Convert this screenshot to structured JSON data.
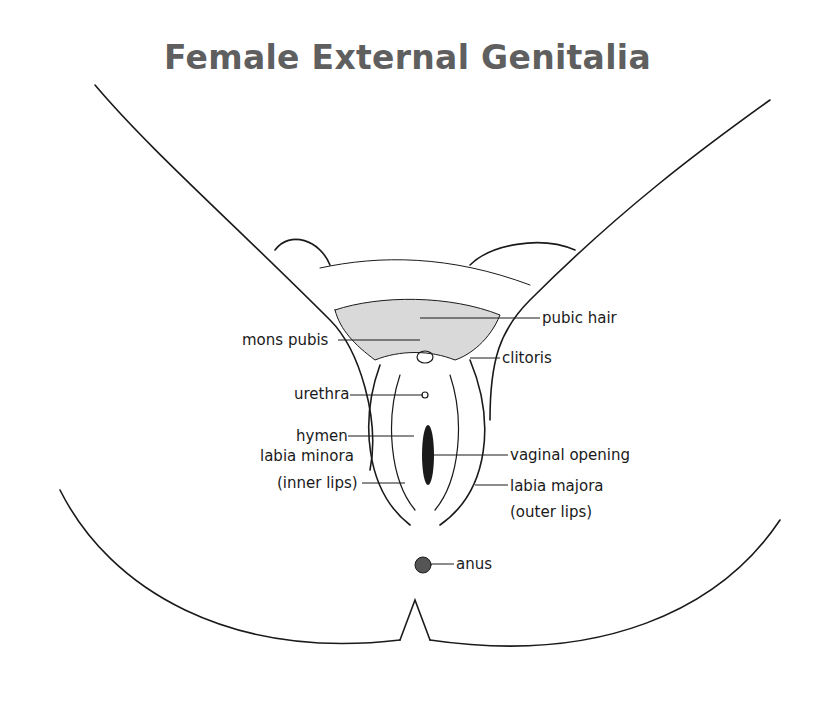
{
  "title": "Female External Genitalia",
  "labels": {
    "pubic_hair": "pubic hair",
    "mons_pubis": "mons pubis",
    "clitoris": "clitoris",
    "urethra": "urethra",
    "hymen": "hymen",
    "labia_minora_line1": "labia minora",
    "labia_minora_line2": "(inner lips)",
    "vaginal_opening": "vaginal opening",
    "labia_majora_line1": "labia majora",
    "labia_majora_line2": "(outer lips)",
    "anus": "anus"
  }
}
